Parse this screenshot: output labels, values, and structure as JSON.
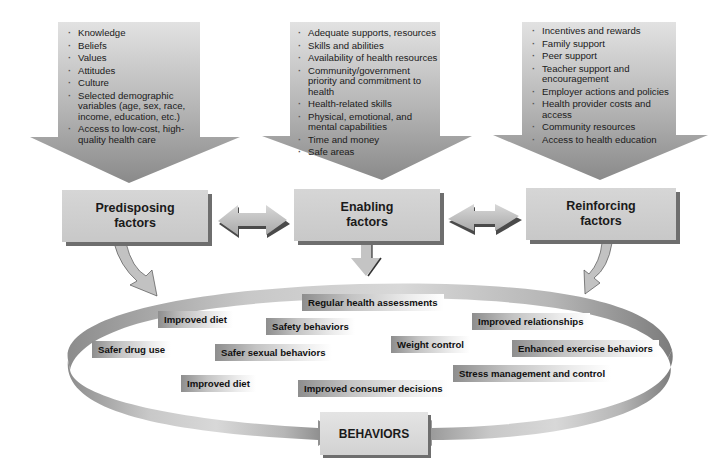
{
  "diagram": {
    "type": "flow-model",
    "input_arrows": [
      {
        "id": "predisposing",
        "items": [
          "Knowledge",
          "Beliefs",
          "Values",
          "Attitudes",
          "Culture",
          "Selected demographic variables (age, sex, race, income, education, etc.)",
          "Access to low-cost, high-quality health care"
        ]
      },
      {
        "id": "enabling",
        "items": [
          "Adequate supports, resources",
          "Skills and abilities",
          "Availability of health resources",
          "Community/government priority and commitment to health",
          "Health-related skills",
          "Physical, emotional, and mental capabilities",
          "Time and money",
          "Safe areas"
        ]
      },
      {
        "id": "reinforcing",
        "items": [
          "Incentives and rewards",
          "Family support",
          "Peer support",
          "Teacher support and encouragement",
          "Employer actions and policies",
          "Health provider costs and access",
          "Community resources",
          "Access to health education"
        ]
      }
    ],
    "factor_boxes": [
      {
        "id": "predisposing",
        "label": "Predisposing\nfactors"
      },
      {
        "id": "enabling",
        "label": "Enabling\nfactors"
      },
      {
        "id": "reinforcing",
        "label": "Reinforcing\nfactors"
      }
    ],
    "connectors": [
      {
        "from": "predisposing",
        "to": "enabling",
        "type": "double-arrow"
      },
      {
        "from": "enabling",
        "to": "reinforcing",
        "type": "double-arrow"
      },
      {
        "from": "predisposing",
        "to": "behavior-loop",
        "type": "curved-arrow"
      },
      {
        "from": "enabling",
        "to": "behavior-loop",
        "type": "straight-arrow"
      },
      {
        "from": "reinforcing",
        "to": "behavior-loop",
        "type": "curved-arrow"
      }
    ],
    "behavior_tags": [
      "Regular health assessments",
      "Improved diet",
      "Safety behaviors",
      "Improved relationships",
      "Safer drug use",
      "Safer sexual behaviors",
      "Weight control",
      "Enhanced exercise behaviors",
      "Improved diet",
      "Improved consumer decisions",
      "Stress management and control"
    ],
    "outcome": {
      "label": "BEHAVIORS"
    },
    "colors": {
      "arrow_gray": "#9a9a9a",
      "box_gray": "#cfcfcf",
      "shadow": "#6e6e6e",
      "text": "#1a1a1a"
    }
  }
}
